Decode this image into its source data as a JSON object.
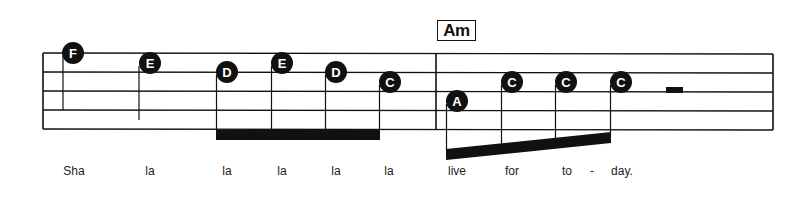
{
  "score": {
    "chord_symbol": "Am",
    "staff": {
      "line_count": 5,
      "line_y": [
        53,
        72,
        91,
        110,
        129
      ],
      "left_x": 43,
      "right_x": 773,
      "barline_x": 436,
      "color": "#111111"
    },
    "measures": [
      {
        "notes": [
          {
            "name": "F",
            "x": 73,
            "y": 53,
            "lyric": "Sha"
          },
          {
            "name": "E",
            "x": 150,
            "y": 63,
            "lyric": "la"
          },
          {
            "name": "D",
            "x": 227,
            "y": 72,
            "lyric": "la"
          },
          {
            "name": "E",
            "x": 282,
            "y": 63,
            "lyric": "la"
          },
          {
            "name": "D",
            "x": 336,
            "y": 72,
            "lyric": "la"
          },
          {
            "name": "C",
            "x": 390,
            "y": 82,
            "lyric": "la"
          }
        ]
      },
      {
        "chord": "Am",
        "notes": [
          {
            "name": "A",
            "x": 457,
            "y": 101,
            "lyric": "live"
          },
          {
            "name": "C",
            "x": 512,
            "y": 82,
            "lyric": "for"
          },
          {
            "name": "C",
            "x": 566,
            "y": 82,
            "lyric": "to"
          },
          {
            "name": "C",
            "x": 621,
            "y": 82,
            "lyric": "day."
          }
        ],
        "rest": "half-rest"
      }
    ],
    "lyrics": [
      {
        "text": "Sha",
        "x": 74
      },
      {
        "text": "la",
        "x": 150
      },
      {
        "text": "la",
        "x": 227
      },
      {
        "text": "la",
        "x": 282
      },
      {
        "text": "la",
        "x": 336
      },
      {
        "text": "la",
        "x": 389
      },
      {
        "text": "live",
        "x": 457
      },
      {
        "text": "for",
        "x": 512
      },
      {
        "text": "to",
        "x": 567
      },
      {
        "text": "-",
        "x": 592
      },
      {
        "text": "day.",
        "x": 622
      }
    ]
  }
}
